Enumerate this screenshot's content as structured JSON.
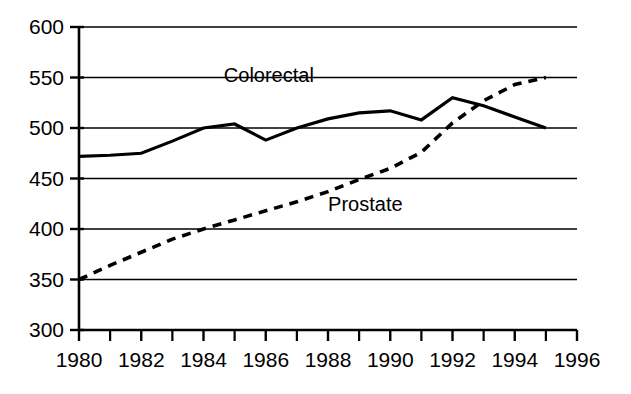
{
  "chart_data": {
    "type": "line",
    "title": "",
    "subtitle": "",
    "xlabel": "",
    "ylabel": "",
    "xlim": [
      1980,
      1996
    ],
    "ylim": [
      300,
      600
    ],
    "grid": true,
    "grid_axis": "y",
    "legend_position": "inline-annotation",
    "x_ticks_major": [
      1980,
      1982,
      1984,
      1986,
      1988,
      1990,
      1992,
      1994,
      1996
    ],
    "x_tick_labels": [
      "1980",
      "1982",
      "1984",
      "1986",
      "1988",
      "1990",
      "1992",
      "1994",
      "1996"
    ],
    "x_ticks_minor": [
      1981,
      1983,
      1985,
      1987,
      1989,
      1991,
      1993,
      1995
    ],
    "y_ticks": [
      300,
      350,
      400,
      450,
      500,
      550,
      600
    ],
    "y_tick_labels": [
      "300",
      "350",
      "400",
      "450",
      "500",
      "550",
      "600"
    ],
    "x": [
      1980,
      1981,
      1982,
      1983,
      1984,
      1985,
      1986,
      1987,
      1988,
      1989,
      1990,
      1991,
      1992,
      1993,
      1994,
      1995
    ],
    "series": [
      {
        "name": "Colorectal",
        "style": "solid",
        "color": "#000000",
        "width": 3.2,
        "label_x": 1986.1,
        "label_y": 546,
        "values": [
          472,
          473,
          475,
          487,
          500,
          504,
          488,
          500,
          509,
          515,
          517,
          508,
          530,
          522,
          511,
          500
        ]
      },
      {
        "name": "Prostate",
        "style": "dashed",
        "color": "#000000",
        "width": 3.6,
        "label_x": 1989.2,
        "label_y": 418,
        "values": [
          350,
          364,
          377,
          390,
          400,
          409,
          418,
          427,
          437,
          449,
          460,
          476,
          505,
          527,
          543,
          550
        ]
      }
    ]
  },
  "axes": {
    "y_axis_name": "y-axis",
    "x_axis_name": "x-axis"
  }
}
